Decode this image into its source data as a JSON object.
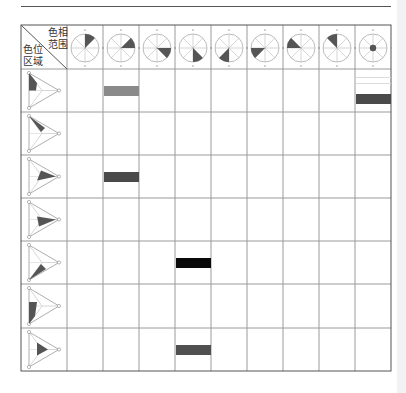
{
  "header": {
    "corner_top_right": [
      "色相",
      "范围"
    ],
    "corner_bottom_left": [
      "色位",
      "区域"
    ]
  },
  "colors": {
    "grid": "#9a9a9a",
    "outline": "#555555",
    "wedge": "#555555",
    "bar_gray": "#8a8a8a",
    "bar_dark": "#4a4a4a",
    "bar_black": "#0a0a0a",
    "bar_mid": "#505050",
    "bar_light": "#dcdcdc"
  },
  "hue_columns": [
    {
      "id": 1,
      "wedge": [
        0,
        45
      ]
    },
    {
      "id": 2,
      "wedge": [
        45,
        90
      ]
    },
    {
      "id": 3,
      "wedge": [
        90,
        135
      ]
    },
    {
      "id": 4,
      "wedge": [
        135,
        180
      ]
    },
    {
      "id": 5,
      "wedge": [
        180,
        225
      ]
    },
    {
      "id": 6,
      "wedge": [
        225,
        270
      ]
    },
    {
      "id": 7,
      "wedge": [
        270,
        315
      ]
    },
    {
      "id": 8,
      "wedge": [
        315,
        360
      ]
    },
    {
      "id": 9,
      "center_dot": true
    }
  ],
  "position_rows": [
    {
      "id": 1,
      "region": "left-top"
    },
    {
      "id": 2,
      "region": "top-right"
    },
    {
      "id": 3,
      "region": "right"
    },
    {
      "id": 4,
      "region": "right-bottom"
    },
    {
      "id": 5,
      "region": "bottom-left"
    },
    {
      "id": 6,
      "region": "left-bottom"
    },
    {
      "id": 7,
      "region": "center"
    }
  ],
  "marks": [
    {
      "row": 1,
      "col": 2,
      "shade": "bar_gray"
    },
    {
      "row": 1,
      "col": 9,
      "shade": "bar_dark",
      "extra_lines": true
    },
    {
      "row": 3,
      "col": 2,
      "shade": "bar_dark"
    },
    {
      "row": 5,
      "col": 4,
      "shade": "bar_black"
    },
    {
      "row": 7,
      "col": 4,
      "shade": "bar_mid"
    }
  ]
}
